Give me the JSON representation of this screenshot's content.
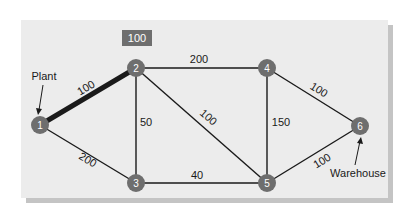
{
  "diagram": {
    "type": "network-shortest-path",
    "badge": {
      "label": "100"
    },
    "nodes": [
      {
        "id": "1",
        "label": "1"
      },
      {
        "id": "2",
        "label": "2"
      },
      {
        "id": "3",
        "label": "3"
      },
      {
        "id": "4",
        "label": "4"
      },
      {
        "id": "5",
        "label": "5"
      },
      {
        "id": "6",
        "label": "6"
      }
    ],
    "edges": [
      {
        "from": "1",
        "to": "2",
        "weight": "100",
        "highlighted": true
      },
      {
        "from": "1",
        "to": "3",
        "weight": "200",
        "highlighted": false
      },
      {
        "from": "2",
        "to": "3",
        "weight": "50",
        "highlighted": false
      },
      {
        "from": "2",
        "to": "4",
        "weight": "200",
        "highlighted": false
      },
      {
        "from": "2",
        "to": "5",
        "weight": "100",
        "highlighted": false
      },
      {
        "from": "3",
        "to": "5",
        "weight": "40",
        "highlighted": false
      },
      {
        "from": "4",
        "to": "5",
        "weight": "150",
        "highlighted": false
      },
      {
        "from": "4",
        "to": "6",
        "weight": "100",
        "highlighted": false
      },
      {
        "from": "5",
        "to": "6",
        "weight": "100",
        "highlighted": false
      }
    ],
    "callouts": {
      "source": {
        "label": "Plant",
        "node": "1"
      },
      "sink": {
        "label": "Warehouse",
        "node": "6"
      }
    },
    "colors": {
      "panel": "#ececec",
      "panel_shadow": "#c4c4c4",
      "node_fill": "#6e6e6e",
      "edge": "#1a1a1a",
      "badge_fill": "#6e6e6e"
    }
  }
}
